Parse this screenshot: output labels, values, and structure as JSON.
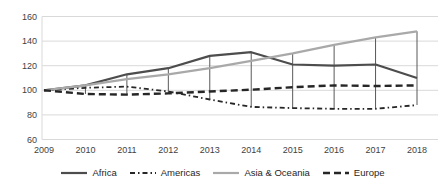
{
  "chart": {
    "background": "#ffffff",
    "grid_color": "#d9d9d9",
    "axis_text_color": "#3f3f3f",
    "high_low_line_color": "#595959"
  },
  "chart_data": {
    "type": "line",
    "title": "",
    "x_labels": [
      "2009",
      "2010",
      "2011",
      "2012",
      "2013",
      "2014",
      "2015",
      "2016",
      "2017",
      "2018"
    ],
    "y_ticks": [
      60,
      80,
      100,
      120,
      140,
      160
    ],
    "ylim": [
      60,
      160
    ],
    "grid": "horizontal",
    "high_low_lines": true,
    "legend_position": "bottom",
    "series": [
      {
        "name": "Africa",
        "style": "solid",
        "color": "#4d4d4d",
        "width": 2.2,
        "values": [
          100,
          104,
          113,
          118,
          128,
          131,
          121,
          120,
          121,
          110
        ]
      },
      {
        "name": "Americas",
        "style": "dashdot",
        "color": "#262626",
        "width": 1.8,
        "values": [
          100,
          102,
          103,
          99,
          92.5,
          86.5,
          85.5,
          85,
          85,
          88
        ]
      },
      {
        "name": "Asia & Oceania",
        "style": "solid",
        "color": "#a9a9a9",
        "width": 2.2,
        "values": [
          100,
          104,
          109,
          113,
          118,
          124,
          130,
          137,
          143,
          148
        ]
      },
      {
        "name": "Europe",
        "style": "dashed",
        "color": "#262626",
        "width": 2.4,
        "values": [
          100,
          97,
          96.5,
          97.5,
          99,
          100.5,
          102.5,
          104,
          103.5,
          104
        ]
      }
    ]
  }
}
